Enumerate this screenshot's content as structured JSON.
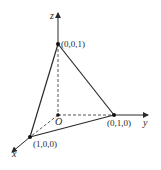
{
  "diagram": {
    "type": "3d-coordinate-tetrahedron",
    "axes": {
      "x_label": "x",
      "y_label": "y",
      "z_label": "z",
      "origin_label": "O"
    },
    "points": [
      {
        "name": "A",
        "label": "(1,0,0)"
      },
      {
        "name": "B",
        "label": "(0,1,0)"
      },
      {
        "name": "C",
        "label": "(0,0,1)"
      }
    ],
    "colors": {
      "line": "#2a2a2a",
      "background": "#ffffff"
    }
  }
}
